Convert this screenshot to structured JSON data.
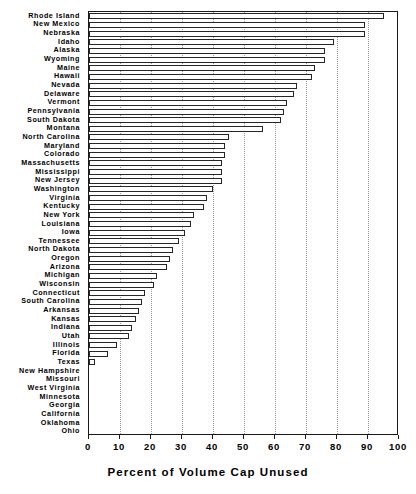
{
  "chart_data": {
    "type": "bar",
    "orientation": "horizontal",
    "title": "",
    "xlabel": "Percent of Volume Cap Unused",
    "ylabel": "",
    "xlim": [
      0,
      100
    ],
    "ylim": null,
    "grid": true,
    "grid_axis": "x",
    "legend": null,
    "xticks": [
      0,
      10,
      20,
      30,
      40,
      50,
      60,
      70,
      80,
      90,
      100
    ],
    "xtick_labels": [
      "0",
      "10",
      "20",
      "30",
      "40",
      "50",
      "60",
      "70",
      "80",
      "90",
      "100"
    ],
    "sorted": "descending",
    "categories": [
      "Rhode Island",
      "New Mexico",
      "Nebraska",
      "Idaho",
      "Alaska",
      "Wyoming",
      "Maine",
      "Hawaii",
      "Nevada",
      "Delaware",
      "Vermont",
      "Pennsylvania",
      "South Dakota",
      "Montana",
      "North Carolina",
      "Maryland",
      "Colorado",
      "Massachusetts",
      "Mississippi",
      "New Jersey",
      "Washington",
      "Virginia",
      "Kentucky",
      "New York",
      "Louisiana",
      "Iowa",
      "Tennessee",
      "North Dakota",
      "Oregon",
      "Arizona",
      "Michigan",
      "Wisconsin",
      "Connecticut",
      "South Carolina",
      "Arkansas",
      "Kansas",
      "Indiana",
      "Utah",
      "Illinois",
      "Florida",
      "Texas",
      "New Hampshire",
      "Missouri",
      "West Virginia",
      "Minnesota",
      "Georgia",
      "California",
      "Oklahoma",
      "Ohio"
    ],
    "values": [
      95,
      89,
      89,
      79,
      76,
      76,
      73,
      72,
      67,
      66,
      64,
      63,
      62,
      56,
      45,
      44,
      44,
      43,
      43,
      43,
      40,
      38,
      37,
      34,
      33,
      31,
      29,
      27,
      26,
      25,
      22,
      21,
      18,
      17,
      16,
      15,
      14,
      13,
      9,
      6,
      2,
      0,
      0,
      0,
      0,
      0,
      0,
      0,
      0
    ],
    "value_unit": "percent",
    "series_name": "Percent of Volume Cap Unused"
  }
}
